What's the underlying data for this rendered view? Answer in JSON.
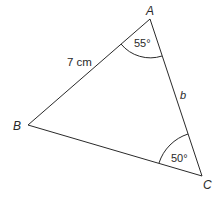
{
  "diagram": {
    "type": "triangle",
    "vertices": {
      "A": {
        "label": "A",
        "x": 150,
        "y": 19
      },
      "B": {
        "label": "B",
        "x": 28,
        "y": 125
      },
      "C": {
        "label": "C",
        "x": 202,
        "y": 176
      }
    },
    "sides": {
      "AB": {
        "label": "7 cm"
      },
      "AC": {
        "label": "b"
      }
    },
    "angles": {
      "A": {
        "label": "55°"
      },
      "C": {
        "label": "50°"
      }
    },
    "colors": {
      "line": "#2a2a2a",
      "background": "#ffffff"
    }
  }
}
